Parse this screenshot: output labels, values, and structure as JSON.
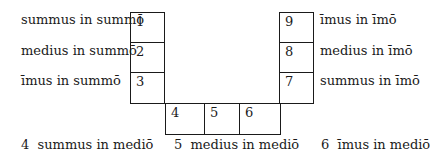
{
  "diagram": {
    "left_column": [
      {
        "number": "1",
        "label": "summus in summō"
      },
      {
        "number": "2",
        "label": "medius in summō"
      },
      {
        "number": "3",
        "label": "īmus in summō"
      }
    ],
    "bottom_row": [
      {
        "number": "4",
        "label": "4  summus in mediō"
      },
      {
        "number": "5",
        "label": "5  medius in mediō"
      },
      {
        "number": "6",
        "label": "6  īmus in mediō"
      }
    ],
    "right_column": [
      {
        "number": "9",
        "label": "īmus in īmō"
      },
      {
        "number": "8",
        "label": "medius in īmō"
      },
      {
        "number": "7",
        "label": "summus in īmō"
      }
    ]
  }
}
